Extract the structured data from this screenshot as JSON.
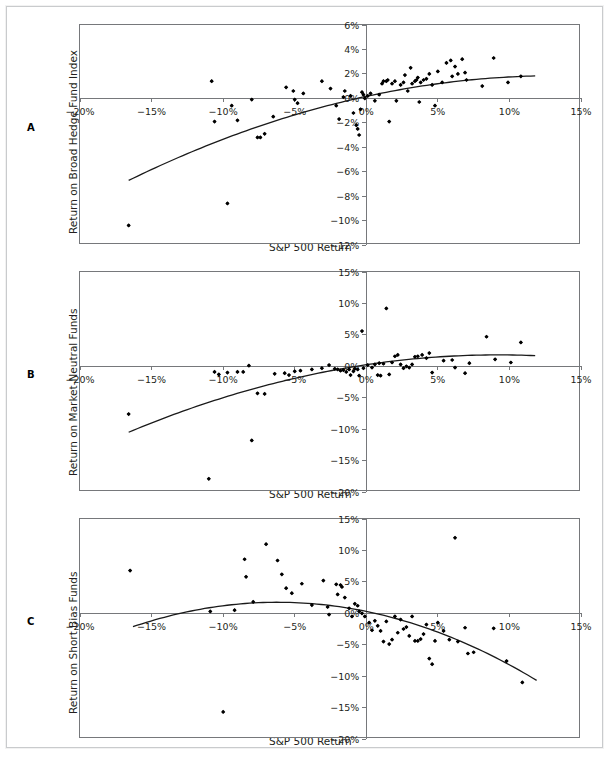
{
  "figure": {
    "panels": [
      {
        "letter": "A",
        "ylabel": "Return on Broad Hedge Fund Index",
        "xlabel": "S&P 500 Return"
      },
      {
        "letter": "B",
        "ylabel": "Return on Market-Neutral Funds",
        "xlabel": "S&P 500 Return"
      },
      {
        "letter": "C",
        "ylabel": "Return on Short Bias Funds",
        "xlabel": "S&P 500 Return"
      }
    ]
  },
  "chart_data": [
    {
      "type": "scatter",
      "panel": "A",
      "title": "",
      "xlabel": "S&P 500 Return",
      "ylabel": "Return on Broad Hedge Fund Index",
      "xlim": [
        -20,
        15
      ],
      "ylim": [
        -12,
        6
      ],
      "xticks": [
        -20,
        -15,
        -10,
        -5,
        0,
        5,
        10,
        15
      ],
      "xticklabels": [
        "−20%",
        "−15%",
        "−10%",
        "−5%",
        "0%",
        "5%",
        "10%",
        "15%"
      ],
      "yticks": [
        -12,
        -10,
        -8,
        -6,
        -4,
        -2,
        0,
        2,
        4,
        6
      ],
      "yticklabels": [
        "−12%",
        "−10%",
        "−8%",
        "−6%",
        "−4%",
        "−2%",
        "0%",
        "2%",
        "4%",
        "6%"
      ],
      "grid": false,
      "legend": null,
      "points": [
        [
          -16.6,
          -10.4
        ],
        [
          -10.8,
          1.4
        ],
        [
          -10.6,
          -1.9
        ],
        [
          -9.7,
          -8.6
        ],
        [
          -9.4,
          -0.6
        ],
        [
          -9.0,
          -1.8
        ],
        [
          -8.0,
          -0.1
        ],
        [
          -7.6,
          -3.2
        ],
        [
          -7.4,
          -3.2
        ],
        [
          -7.1,
          -2.9
        ],
        [
          -6.5,
          -1.5
        ],
        [
          -5.6,
          0.9
        ],
        [
          -5.1,
          0.6
        ],
        [
          -5.0,
          -0.1
        ],
        [
          -4.8,
          -0.4
        ],
        [
          -4.4,
          0.4
        ],
        [
          -3.1,
          1.4
        ],
        [
          -2.5,
          0.8
        ],
        [
          -2.1,
          -0.6
        ],
        [
          -1.9,
          -1.7
        ],
        [
          -1.6,
          0.1
        ],
        [
          -1.5,
          0.6
        ],
        [
          -1.1,
          0.2
        ],
        [
          -0.9,
          -1.2
        ],
        [
          -0.7,
          -2.2
        ],
        [
          -0.6,
          -2.5
        ],
        [
          -0.5,
          -3.0
        ],
        [
          -0.4,
          -0.9
        ],
        [
          -0.3,
          0.5
        ],
        [
          -0.2,
          0.3
        ],
        [
          -0.1,
          0.0
        ],
        [
          0.1,
          0.2
        ],
        [
          0.3,
          0.4
        ],
        [
          0.6,
          -0.2
        ],
        [
          0.9,
          0.3
        ],
        [
          1.1,
          1.2
        ],
        [
          1.2,
          1.4
        ],
        [
          1.4,
          1.4
        ],
        [
          1.5,
          1.5
        ],
        [
          1.6,
          -1.9
        ],
        [
          1.8,
          1.2
        ],
        [
          2.0,
          1.4
        ],
        [
          2.1,
          -0.2
        ],
        [
          2.4,
          1.1
        ],
        [
          2.6,
          1.3
        ],
        [
          2.7,
          1.9
        ],
        [
          2.9,
          0.6
        ],
        [
          3.1,
          2.5
        ],
        [
          3.2,
          1.2
        ],
        [
          3.4,
          1.4
        ],
        [
          3.5,
          1.5
        ],
        [
          3.6,
          1.7
        ],
        [
          3.7,
          -0.3
        ],
        [
          3.8,
          1.3
        ],
        [
          4.0,
          1.5
        ],
        [
          4.2,
          1.6
        ],
        [
          4.4,
          2.0
        ],
        [
          4.6,
          1.1
        ],
        [
          4.8,
          -0.6
        ],
        [
          5.0,
          2.2
        ],
        [
          5.3,
          1.3
        ],
        [
          5.6,
          2.9
        ],
        [
          5.9,
          3.1
        ],
        [
          6.0,
          1.8
        ],
        [
          6.2,
          2.6
        ],
        [
          6.4,
          2.0
        ],
        [
          6.7,
          3.2
        ],
        [
          6.9,
          2.1
        ],
        [
          7.0,
          1.5
        ],
        [
          8.1,
          1.0
        ],
        [
          8.9,
          3.3
        ],
        [
          9.9,
          1.3
        ],
        [
          10.8,
          1.8
        ]
      ],
      "fit_curve": {
        "description": "quadratic least-squares fit",
        "x_start": -16.6,
        "x_end": 11.8,
        "coefficients": {
          "a": -0.0096,
          "b": 0.255,
          "c": 0.16
        }
      }
    },
    {
      "type": "scatter",
      "panel": "B",
      "title": "",
      "xlabel": "S&P 500 Return",
      "ylabel": "Return on Market-Neutral Funds",
      "xlim": [
        -20,
        15
      ],
      "ylim": [
        -20,
        15
      ],
      "xticks": [
        -20,
        -15,
        -10,
        -5,
        0,
        5,
        10,
        15
      ],
      "xticklabels": [
        "−20%",
        "−15%",
        "−10%",
        "−5%",
        "0%",
        "5%",
        "10%",
        "15%"
      ],
      "yticks": [
        -20,
        -15,
        -10,
        -5,
        0,
        5,
        10,
        15
      ],
      "yticklabels": [
        "−20%",
        "−15%",
        "−10%",
        "−5%",
        "0%",
        "5%",
        "10%",
        "15%"
      ],
      "grid": false,
      "legend": null,
      "points": [
        [
          -16.6,
          -7.6
        ],
        [
          -11.0,
          -17.9
        ],
        [
          -10.6,
          -0.9
        ],
        [
          -10.3,
          -1.3
        ],
        [
          -9.7,
          -1.0
        ],
        [
          -9.0,
          -0.9
        ],
        [
          -8.6,
          -0.9
        ],
        [
          -8.2,
          0.1
        ],
        [
          -8.0,
          -11.8
        ],
        [
          -7.6,
          -4.3
        ],
        [
          -7.1,
          -4.4
        ],
        [
          -6.4,
          -1.2
        ],
        [
          -5.7,
          -1.1
        ],
        [
          -5.4,
          -1.4
        ],
        [
          -5.0,
          -0.8
        ],
        [
          -4.6,
          -0.7
        ],
        [
          -3.8,
          -0.5
        ],
        [
          -3.1,
          -0.3
        ],
        [
          -2.6,
          0.2
        ],
        [
          -2.2,
          -0.4
        ],
        [
          -2.0,
          -0.5
        ],
        [
          -1.8,
          -0.7
        ],
        [
          -1.6,
          -0.6
        ],
        [
          -1.4,
          -0.9
        ],
        [
          -1.2,
          -0.5
        ],
        [
          -1.1,
          -1.4
        ],
        [
          -0.9,
          -0.8
        ],
        [
          -0.8,
          -0.4
        ],
        [
          -0.6,
          -0.5
        ],
        [
          -0.5,
          -1.5
        ],
        [
          -0.3,
          5.6
        ],
        [
          -0.2,
          -0.3
        ],
        [
          0.1,
          0.2
        ],
        [
          0.4,
          -0.2
        ],
        [
          0.6,
          0.3
        ],
        [
          0.8,
          -1.4
        ],
        [
          0.9,
          0.5
        ],
        [
          1.0,
          -1.5
        ],
        [
          1.2,
          0.4
        ],
        [
          1.4,
          9.2
        ],
        [
          1.6,
          -1.3
        ],
        [
          1.8,
          0.6
        ],
        [
          2.0,
          1.6
        ],
        [
          2.2,
          1.8
        ],
        [
          2.4,
          0.3
        ],
        [
          2.6,
          -0.3
        ],
        [
          2.8,
          0.0
        ],
        [
          3.0,
          -0.2
        ],
        [
          3.2,
          0.3
        ],
        [
          3.4,
          1.5
        ],
        [
          3.6,
          1.6
        ],
        [
          3.9,
          1.8
        ],
        [
          4.2,
          1.3
        ],
        [
          4.4,
          2.1
        ],
        [
          4.6,
          -1.0
        ],
        [
          5.4,
          0.9
        ],
        [
          6.0,
          1.0
        ],
        [
          6.2,
          -0.2
        ],
        [
          6.9,
          -1.1
        ],
        [
          7.2,
          0.5
        ],
        [
          8.4,
          4.7
        ],
        [
          9.0,
          1.1
        ],
        [
          10.1,
          0.6
        ],
        [
          10.8,
          3.8
        ]
      ],
      "fit_curve": {
        "description": "quadratic least-squares fit",
        "x_start": -16.6,
        "x_end": 11.8,
        "coefficients": {
          "a": -0.0185,
          "b": 0.34,
          "c": 0.25
        }
      }
    },
    {
      "type": "scatter",
      "panel": "C",
      "title": "",
      "xlabel": "S&P 500 Return",
      "ylabel": "Return on Short Bias Funds",
      "xlim": [
        -20,
        15
      ],
      "ylim": [
        -20,
        15
      ],
      "xticks": [
        -20,
        -15,
        -10,
        -5,
        0,
        5,
        10,
        15
      ],
      "xticklabels": [
        "−20%",
        "−15%",
        "−10%",
        "−5%",
        "0%",
        "5%",
        "10%",
        "15%"
      ],
      "yticks": [
        -20,
        -15,
        -10,
        -5,
        0,
        5,
        10,
        15
      ],
      "yticklabels": [
        "−20%",
        "−15%",
        "−10%",
        "−5%",
        "0%",
        "5%",
        "10%",
        "15%"
      ],
      "grid": false,
      "legend": null,
      "points": [
        [
          -16.5,
          6.8
        ],
        [
          -10.9,
          0.3
        ],
        [
          -10.0,
          -15.7
        ],
        [
          -9.2,
          0.5
        ],
        [
          -8.5,
          8.6
        ],
        [
          -8.4,
          5.8
        ],
        [
          -7.9,
          1.8
        ],
        [
          -7.0,
          11.0
        ],
        [
          -6.2,
          8.4
        ],
        [
          -5.9,
          6.2
        ],
        [
          -5.6,
          4.0
        ],
        [
          -5.2,
          3.2
        ],
        [
          -4.5,
          4.7
        ],
        [
          -3.8,
          1.3
        ],
        [
          -3.0,
          5.2
        ],
        [
          -2.7,
          1.0
        ],
        [
          -2.6,
          -0.2
        ],
        [
          -2.1,
          4.6
        ],
        [
          -2.0,
          3.0
        ],
        [
          -1.8,
          4.5
        ],
        [
          -1.7,
          4.2
        ],
        [
          -1.5,
          2.5
        ],
        [
          -1.2,
          0.8
        ],
        [
          -1.0,
          -0.5
        ],
        [
          -0.8,
          1.5
        ],
        [
          -0.6,
          1.2
        ],
        [
          -0.5,
          0.3
        ],
        [
          -0.3,
          0.0
        ],
        [
          -0.1,
          -0.5
        ],
        [
          0.2,
          -1.5
        ],
        [
          0.4,
          -2.7
        ],
        [
          0.6,
          -1.2
        ],
        [
          0.8,
          -2.0
        ],
        [
          1.0,
          -2.8
        ],
        [
          1.2,
          -4.5
        ],
        [
          1.4,
          -1.3
        ],
        [
          1.6,
          -4.9
        ],
        [
          1.8,
          -4.2
        ],
        [
          2.0,
          -0.5
        ],
        [
          2.2,
          -3.1
        ],
        [
          2.4,
          -1.0
        ],
        [
          2.6,
          -2.5
        ],
        [
          2.8,
          -2.2
        ],
        [
          3.0,
          -3.6
        ],
        [
          3.2,
          -0.5
        ],
        [
          3.4,
          -4.4
        ],
        [
          3.6,
          -4.4
        ],
        [
          3.8,
          -4.1
        ],
        [
          4.0,
          -3.3
        ],
        [
          4.2,
          -1.8
        ],
        [
          4.4,
          -7.2
        ],
        [
          4.6,
          -8.1
        ],
        [
          4.8,
          -4.4
        ],
        [
          5.0,
          -1.5
        ],
        [
          5.4,
          -2.8
        ],
        [
          5.8,
          -4.2
        ],
        [
          6.2,
          12.0
        ],
        [
          6.4,
          -4.5
        ],
        [
          6.9,
          -2.3
        ],
        [
          7.1,
          -6.4
        ],
        [
          7.5,
          -6.2
        ],
        [
          8.9,
          -2.4
        ],
        [
          9.8,
          -7.6
        ],
        [
          10.9,
          -11.0
        ]
      ],
      "fit_curve": {
        "description": "quadratic least-squares fit",
        "x_start": -16.3,
        "x_end": 11.9,
        "coefficients": {
          "a": -0.038,
          "b": -0.47,
          "c": 0.3
        }
      }
    }
  ]
}
